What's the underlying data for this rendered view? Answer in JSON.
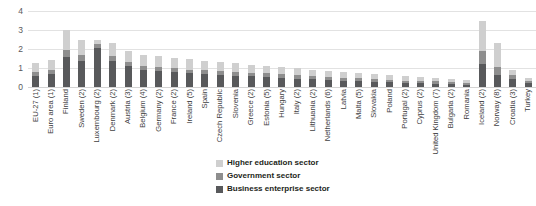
{
  "chart_data": {
    "type": "bar",
    "subtype": "stacked-vertical",
    "title": "",
    "xlabel": "",
    "ylabel": "",
    "ylim": [
      0,
      4
    ],
    "ytick_labels": [
      "0",
      "1",
      "2",
      "3",
      "4"
    ],
    "ytick_values": [
      0,
      1,
      2,
      3,
      4
    ],
    "grid": true,
    "grid_axis": "y",
    "legend_position": "bottom-center",
    "categories": [
      "EU-27 (1)",
      "Euro area (1)",
      "Finland",
      "Sweden (2)",
      "Luxembourg (2)",
      "Denmark (2)",
      "Austria (3)",
      "Belgium (4)",
      "Germany (2)",
      "France (2)",
      "Ireland (5)",
      "Spain",
      "Czech Republic",
      "Slovenia",
      "Greece (2)",
      "Estonia (5)",
      "Hungary",
      "Italy (2)",
      "Lithuania (2)",
      "Netherlands (6)",
      "Latvia",
      "Malta (5)",
      "Slovakia",
      "Poland",
      "Portugal (2)",
      "Cyprus (2)",
      "United Kingdom (7)",
      "Bulgaria (2)",
      "Romania",
      "Iceland (2)",
      "Norway (8)",
      "Croatia (3)",
      "Turkey"
    ],
    "series": [
      {
        "name": "Business enterprise sector",
        "color": "#58595b",
        "values": [
          0.58,
          0.66,
          1.6,
          1.38,
          2.05,
          1.37,
          1.08,
          0.88,
          0.82,
          0.78,
          0.72,
          0.7,
          0.62,
          0.6,
          0.56,
          0.52,
          0.48,
          0.44,
          0.4,
          0.36,
          0.33,
          0.31,
          0.28,
          0.25,
          0.22,
          0.2,
          0.18,
          0.15,
          0.13,
          1.2,
          0.62,
          0.42,
          0.22
        ]
      },
      {
        "name": "Government sector",
        "color": "#8e8e8e",
        "values": [
          0.22,
          0.22,
          0.36,
          0.3,
          0.22,
          0.28,
          0.26,
          0.24,
          0.24,
          0.24,
          0.2,
          0.2,
          0.22,
          0.2,
          0.18,
          0.2,
          0.18,
          0.18,
          0.18,
          0.16,
          0.16,
          0.14,
          0.14,
          0.14,
          0.12,
          0.12,
          0.12,
          0.12,
          0.1,
          0.7,
          0.42,
          0.2,
          0.1
        ]
      },
      {
        "name": "Higher education sector",
        "color": "#cfcfcf",
        "values": [
          0.48,
          0.54,
          1.04,
          0.82,
          0.23,
          0.65,
          0.56,
          0.58,
          0.56,
          0.5,
          0.58,
          0.48,
          0.46,
          0.44,
          0.44,
          0.4,
          0.38,
          0.36,
          0.34,
          0.34,
          0.3,
          0.28,
          0.26,
          0.24,
          0.24,
          0.2,
          0.18,
          0.16,
          0.14,
          1.6,
          1.26,
          0.28,
          0.14
        ]
      }
    ]
  },
  "legend": {
    "items": [
      {
        "label": "Higher education sector",
        "color": "#cfcfcf"
      },
      {
        "label": "Government sector",
        "color": "#8e8e8e"
      },
      {
        "label": "Business enterprise sector",
        "color": "#58595b"
      }
    ]
  }
}
